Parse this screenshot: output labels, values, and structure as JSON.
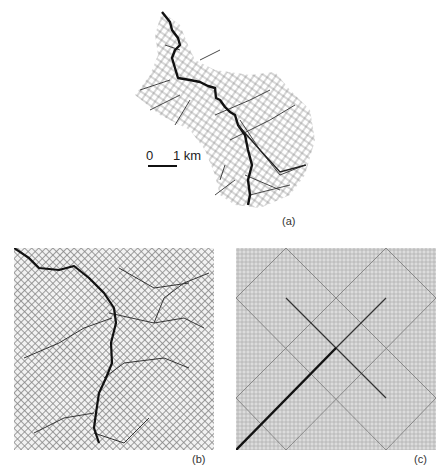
{
  "figure": {
    "panels": [
      {
        "id": "a",
        "label": "(a)",
        "description": "Natural river network with main stem highlighted"
      },
      {
        "id": "b",
        "label": "(b)",
        "description": "Optimal channel network on square lattice"
      },
      {
        "id": "c",
        "label": "(c)",
        "description": "Peano network on square lattice"
      }
    ],
    "scale_bar": {
      "start": "0",
      "end": "1 km"
    }
  }
}
